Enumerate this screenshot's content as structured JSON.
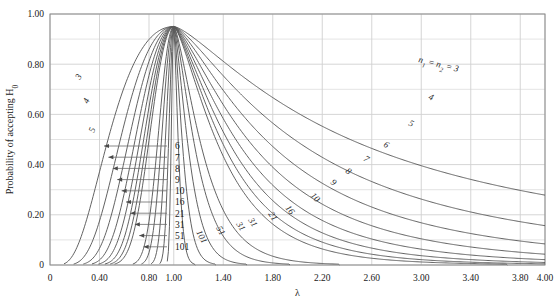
{
  "chart_data": {
    "type": "line",
    "title": "",
    "subtitle": "",
    "xlabel": "λ",
    "ylabel": "Probability of accepting H₀",
    "xlim": [
      0,
      4.0
    ],
    "ylim": [
      0,
      1.0
    ],
    "grid": true,
    "legend_position": "inline-curve-labels",
    "annotation": "n₁ = n₂ = 3",
    "alpha_level": 0.05,
    "peak_value": 0.95,
    "peak_x": 1.0,
    "x_ticks": [
      "0",
      "0.40",
      "0.80",
      "1.00",
      "1.40",
      "1.80",
      "2.20",
      "2.60",
      "3.00",
      "3.40",
      "3.80",
      "4.00"
    ],
    "x_tick_values": [
      0,
      0.4,
      0.8,
      1.0,
      1.4,
      1.8,
      2.2,
      2.6,
      3.0,
      3.4,
      3.8,
      4.0
    ],
    "y_ticks": [
      "0",
      "0.20",
      "0.40",
      "0.60",
      "0.80",
      "1.00"
    ],
    "y_tick_values": [
      0,
      0.2,
      0.4,
      0.6,
      0.8,
      1.0
    ],
    "series": [
      {
        "name": "3",
        "n": 3,
        "label_left": "3",
        "label_right": "n₁ = n₂ = 3"
      },
      {
        "name": "4",
        "n": 4,
        "label_left": "4",
        "label_right": "4"
      },
      {
        "name": "5",
        "n": 5,
        "label_left": "5",
        "label_right": "5"
      },
      {
        "name": "6",
        "n": 6,
        "label_left": "6",
        "label_right": "6"
      },
      {
        "name": "7",
        "n": 7,
        "label_left": "7",
        "label_right": "7"
      },
      {
        "name": "8",
        "n": 8,
        "label_left": "8",
        "label_right": "8"
      },
      {
        "name": "9",
        "n": 9,
        "label_left": "9",
        "label_right": "9"
      },
      {
        "name": "10",
        "n": 10,
        "label_left": "10",
        "label_right": "10"
      },
      {
        "name": "16",
        "n": 16,
        "label_left": "16",
        "label_right": "16"
      },
      {
        "name": "21",
        "n": 21,
        "label_left": "21",
        "label_right": "21"
      },
      {
        "name": "31",
        "n": 31,
        "label_left": "31",
        "label_right": "31"
      },
      {
        "name": "51",
        "n": 51,
        "label_left": "51",
        "label_right": "51"
      },
      {
        "name": "101",
        "n": 101,
        "label_left": "101",
        "label_right": "101"
      }
    ],
    "left_legend_labels": [
      "6",
      "7",
      "8",
      "9",
      "10",
      "16",
      "21",
      "31",
      "51",
      "101"
    ],
    "left_curve_labels": [
      "3",
      "4",
      "5"
    ],
    "right_curve_labels": [
      "4",
      "5",
      "6",
      "7",
      "8",
      "9",
      "10",
      "16",
      "21",
      "31"
    ],
    "lower_curve_labels": [
      "101",
      "51",
      "31",
      "21",
      "16",
      "10"
    ]
  },
  "colors": {
    "curve": "#5a5a5a",
    "grid": "#d0d0d0",
    "axis": "#8a8a8a",
    "text": "#1a1a1a",
    "background": "#ffffff"
  }
}
